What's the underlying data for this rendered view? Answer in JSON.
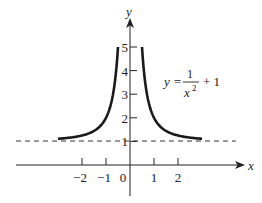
{
  "chart_data": {
    "type": "line",
    "title": "",
    "equation": {
      "lhs": "y =",
      "numerator": "1",
      "denominator_base": "x",
      "denominator_exp": "2",
      "rhs": "+ 1"
    },
    "xlabel": "x",
    "ylabel": "y",
    "x_ticks": [
      -2,
      -1,
      0,
      1,
      2
    ],
    "x_tick_labels": [
      "−2",
      "−1",
      "0",
      "1",
      "2"
    ],
    "y_ticks": [
      1,
      2,
      3,
      4,
      5
    ],
    "y_tick_labels": [
      "1",
      "2",
      "3",
      "4",
      "5"
    ],
    "xlim": [
      -5,
      5
    ],
    "ylim": [
      -1.5,
      6
    ],
    "grid": false,
    "series": [
      {
        "name": "y = 1/x^2 + 1 (left branch)",
        "x": [
          -3,
          -2.5,
          -2,
          -1.5,
          -1,
          -0.8,
          -0.7,
          -0.6,
          -0.5
        ],
        "y": [
          1.11,
          1.16,
          1.25,
          1.44,
          2.0,
          2.56,
          3.04,
          3.78,
          5.0
        ]
      },
      {
        "name": "y = 1/x^2 + 1 (right branch)",
        "x": [
          0.5,
          0.6,
          0.7,
          0.8,
          1,
          1.5,
          2,
          2.5,
          3
        ],
        "y": [
          5.0,
          3.78,
          3.04,
          2.56,
          2.0,
          1.44,
          1.25,
          1.16,
          1.11
        ]
      }
    ],
    "asymptote": {
      "type": "horizontal",
      "y": 1,
      "style": "dashed"
    }
  },
  "colors": {
    "curve": "#1a1a1a",
    "axes": "#222222",
    "asymptote": "#333333"
  }
}
